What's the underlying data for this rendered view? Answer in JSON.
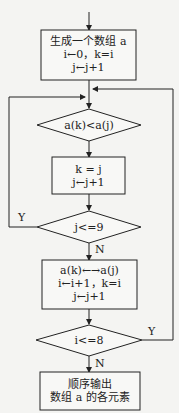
{
  "nodes": {
    "start_box": {
      "lines": [
        "生成一个数组 a",
        "i←0，k=i",
        "j←j+1"
      ]
    },
    "cond1": {
      "text": "a(k)<a(j)"
    },
    "assign_box": {
      "lines": [
        "k = j",
        "j←j+1"
      ]
    },
    "cond2": {
      "text": "j<=9"
    },
    "swap_box": {
      "lines": [
        "a(k)←→a(j)",
        "i←i+1，k=i",
        "j←j+1"
      ]
    },
    "cond3": {
      "text": "i<=8"
    },
    "output_box": {
      "lines": [
        "顺序输出",
        "数组 a 的各元素"
      ]
    }
  },
  "labels": {
    "cond2_yes": "Y",
    "cond2_no": "N",
    "cond3_yes": "Y",
    "cond3_no": "N"
  },
  "colors": {
    "line": "#222222",
    "background": "#f4f4f2"
  }
}
